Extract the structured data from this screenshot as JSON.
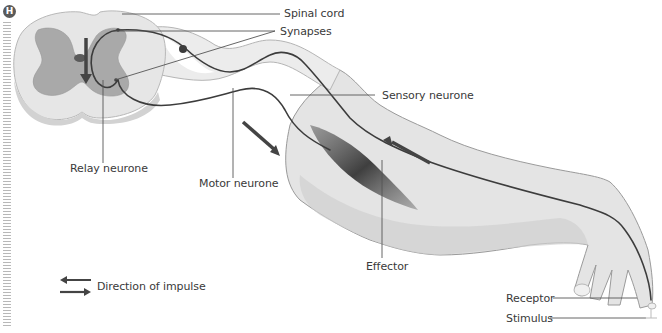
{
  "figure": {
    "badge": "H",
    "labels": {
      "spinal_cord": "Spinal cord",
      "synapses": "Synapses",
      "sensory_neurone": "Sensory neurone",
      "relay_neurone": "Relay neurone",
      "motor_neurone": "Motor neurone",
      "effector": "Effector",
      "receptor": "Receptor",
      "stimulus": "Stimulus"
    },
    "legend": {
      "label": "Direction of impulse",
      "icon": "double-arrow-icon"
    },
    "colors": {
      "neurone_line": "#3c3c3c",
      "arrow": "#444444",
      "grey_matter": "#a8a8a8",
      "white_matter": "#dcdcdc",
      "arm_skin": "#e2e2e2",
      "arm_shadow": "#cfcfcf",
      "muscle": "#4a4a4a",
      "leader_line": "#555555",
      "text": "#3a3a3a"
    }
  }
}
